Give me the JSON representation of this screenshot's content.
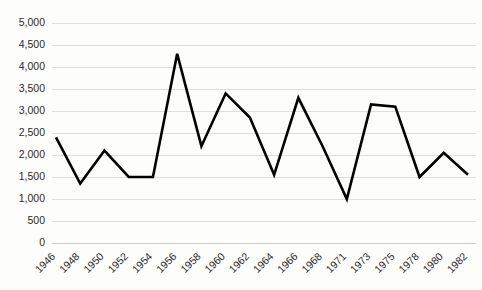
{
  "chart_data": {
    "type": "line",
    "title": "",
    "subtitle": "",
    "xlabel": "",
    "ylabel": "",
    "grid": true,
    "legend": false,
    "legend_position": "none",
    "line_color": "#000000",
    "gridline_color": "#d6d6d6",
    "background_color": "#fdfdfc",
    "text_color": "#2b2b2b",
    "categories": [
      "1946",
      "1948",
      "1950",
      "1952",
      "1954",
      "1956",
      "1958",
      "1960",
      "1962",
      "1964",
      "1966",
      "1968",
      "1971",
      "1973",
      "1975",
      "1978",
      "1980",
      "1982"
    ],
    "values": [
      2400,
      1350,
      2100,
      1500,
      1500,
      4300,
      2200,
      3400,
      2850,
      1550,
      3300,
      2200,
      1000,
      3150,
      3100,
      1500,
      2050,
      1550
    ],
    "ylim": [
      0,
      5000
    ],
    "ytick_values": [
      0,
      500,
      1000,
      1500,
      2000,
      2500,
      3000,
      3500,
      4000,
      4500,
      5000
    ],
    "ytick_labels": [
      "0",
      "500",
      "1,000",
      "1,500",
      "2,000",
      "2,500",
      "3,000",
      "3,500",
      "4,000",
      "4,500",
      "5,000"
    ],
    "xtick_labels": [
      "1946",
      "1948",
      "1950",
      "1952",
      "1954",
      "1956",
      "1958",
      "1960",
      "1962",
      "1964",
      "1966",
      "1968",
      "1971",
      "1973",
      "1975",
      "1978",
      "1980",
      "1982"
    ],
    "xtick_rotation_degrees": -45,
    "annotations": []
  }
}
